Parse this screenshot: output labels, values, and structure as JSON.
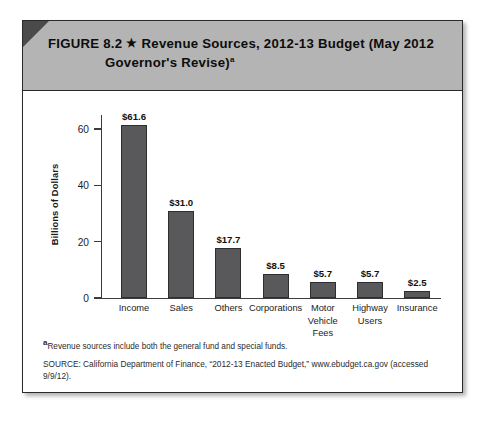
{
  "figure": {
    "label": "FIGURE 8.2",
    "star_icon": "star-icon",
    "title_line1": "Revenue Sources, 2012-13 Budget (May 2012",
    "title_line2": "Governor's Revise)",
    "title_footnote_marker": "a"
  },
  "footnotes": {
    "note_marker": "a",
    "note_text": "Revenue sources include both the general fund and special funds.",
    "source_text": "SOURCE: California Department of Finance, “2012-13 Enacted Budget,” www.ebudget.ca.gov (accessed 9/9/12)."
  },
  "colors": {
    "bar_fill": "#59595b",
    "bar_border": "#2e2e2e",
    "header_band": "#b4b4b4",
    "frame_border": "#2a2a2a",
    "corner_fold": "#4a4a4a"
  },
  "chart_data": {
    "type": "bar",
    "title": "Revenue Sources, 2012-13 Budget (May 2012 Governor's Revise)",
    "xlabel": "",
    "ylabel": "Billions of Dollars",
    "ylim": [
      0,
      65
    ],
    "yticks": [
      0,
      20,
      40,
      60
    ],
    "ytick_labels": [
      "0",
      "20",
      "40",
      "60"
    ],
    "grid": false,
    "legend": false,
    "categories": [
      "Income",
      "Sales",
      "Others",
      "Corporations",
      "Motor Vehicle Fees",
      "Highway Users",
      "Insurance"
    ],
    "category_lines": [
      [
        "Income"
      ],
      [
        "Sales"
      ],
      [
        "Others"
      ],
      [
        "Corporations"
      ],
      [
        "Motor",
        "Vehicle",
        "Fees"
      ],
      [
        "Highway",
        "Users"
      ],
      [
        "Insurance"
      ]
    ],
    "values": [
      61.6,
      31.0,
      17.7,
      8.5,
      5.7,
      5.7,
      2.5
    ],
    "data_labels": [
      "$61.6",
      "$31.0",
      "$17.7",
      "$8.5",
      "$5.7",
      "$5.7",
      "$2.5"
    ]
  }
}
